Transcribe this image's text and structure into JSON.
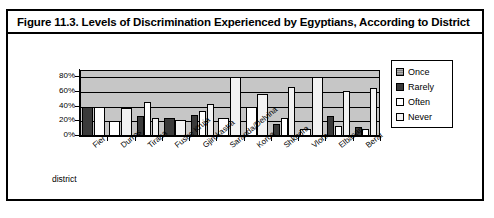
{
  "figure": {
    "caption": "Figure 11.3.  Levels of Discrimination Experienced by Egyptians, According to District"
  },
  "chart_data": {
    "type": "bar",
    "title": "Levels of Discrimination Experienced by Egyptians, According to District",
    "xlabel": "district",
    "ylabel": "",
    "ylim": [
      0,
      90
    ],
    "yticks": [
      0,
      20,
      40,
      60,
      80
    ],
    "ytick_labels": [
      "0%",
      "20%",
      "40%",
      "60%",
      "80%"
    ],
    "grid": true,
    "legend_position": "right",
    "categories": [
      "Fier",
      "Durres",
      "Tirana",
      "Fushe Kruja",
      "Gjirokastra",
      "Saranda/Delvina",
      "Korca",
      "Shkodra",
      "Vlora",
      "Elbasan",
      "Berat"
    ],
    "series": [
      {
        "name": "Once",
        "color": "#b0b0b0",
        "values": [
          0,
          0,
          0,
          0,
          0,
          0,
          0,
          0,
          0,
          0,
          0
        ]
      },
      {
        "name": "Rarely",
        "color": "#3a3a3a",
        "values": [
          40,
          0,
          27,
          24,
          28,
          0,
          0,
          17,
          0,
          27,
          12
        ]
      },
      {
        "name": "Often",
        "color": "#ffffff",
        "values": [
          39,
          20,
          47,
          0,
          34,
          25,
          40,
          24,
          10,
          14,
          9
        ]
      },
      {
        "name": "Never",
        "color": "#f2f2f2",
        "values": [
          0,
          38,
          25,
          22,
          44,
          80,
          57,
          67,
          80,
          61,
          66
        ]
      }
    ],
    "legend": [
      "Once",
      "Rarely",
      "Often",
      "Never"
    ]
  }
}
